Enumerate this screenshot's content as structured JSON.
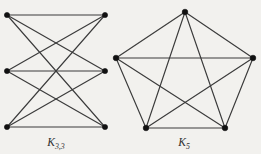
{
  "figure": {
    "name": "nonplanar-graphs-figure",
    "background_color": "#f2f1ee",
    "edge_color": "#3b3b3b",
    "vertex_color": "#111111",
    "caption_color": "#2e2e2e",
    "width": 261,
    "height": 154
  },
  "graphs": [
    {
      "id": "k33",
      "caption_main": "K",
      "caption_sub": "3,3",
      "caption_full": "K3,3",
      "caption_x": 56,
      "caption_y": 146,
      "layout": "bipartite-two-columns",
      "vertex_count": 6,
      "edge_count": 9,
      "vertex_radius": 2.6,
      "vertices": [
        {
          "id": "u1",
          "label": "u1",
          "x": 7,
          "y": 15,
          "part": "left"
        },
        {
          "id": "u2",
          "label": "u2",
          "x": 7,
          "y": 71,
          "part": "left"
        },
        {
          "id": "u3",
          "label": "u3",
          "x": 7,
          "y": 127,
          "part": "left"
        },
        {
          "id": "v1",
          "label": "v1",
          "x": 105,
          "y": 15,
          "part": "right"
        },
        {
          "id": "v2",
          "label": "v2",
          "x": 105,
          "y": 71,
          "part": "right"
        },
        {
          "id": "v3",
          "label": "v3",
          "x": 105,
          "y": 127,
          "part": "right"
        }
      ],
      "edges": [
        {
          "from": "u1",
          "to": "v1"
        },
        {
          "from": "u1",
          "to": "v2"
        },
        {
          "from": "u1",
          "to": "v3"
        },
        {
          "from": "u2",
          "to": "v1"
        },
        {
          "from": "u2",
          "to": "v2"
        },
        {
          "from": "u2",
          "to": "v3"
        },
        {
          "from": "u3",
          "to": "v1"
        },
        {
          "from": "u3",
          "to": "v2"
        },
        {
          "from": "u3",
          "to": "v3"
        }
      ]
    },
    {
      "id": "k5",
      "caption_main": "K",
      "caption_sub": "5",
      "caption_full": "K5",
      "caption_x": 184,
      "caption_y": 146,
      "layout": "regular-pentagon",
      "vertex_count": 5,
      "edge_count": 10,
      "vertex_radius": 2.8,
      "vertices": [
        {
          "id": "p1",
          "label": "p1",
          "x": 185,
          "y": 12,
          "position": "top"
        },
        {
          "id": "p2",
          "label": "p2",
          "x": 253,
          "y": 58,
          "position": "upper-right"
        },
        {
          "id": "p3",
          "label": "p3",
          "x": 225,
          "y": 128,
          "position": "lower-right"
        },
        {
          "id": "p4",
          "label": "p4",
          "x": 146,
          "y": 128,
          "position": "lower-left"
        },
        {
          "id": "p5",
          "label": "p5",
          "x": 116,
          "y": 58,
          "position": "upper-left"
        }
      ],
      "edges": [
        {
          "from": "p1",
          "to": "p2"
        },
        {
          "from": "p2",
          "to": "p3"
        },
        {
          "from": "p3",
          "to": "p4"
        },
        {
          "from": "p4",
          "to": "p5"
        },
        {
          "from": "p5",
          "to": "p1"
        },
        {
          "from": "p1",
          "to": "p3"
        },
        {
          "from": "p1",
          "to": "p4"
        },
        {
          "from": "p2",
          "to": "p4"
        },
        {
          "from": "p2",
          "to": "p5"
        },
        {
          "from": "p3",
          "to": "p5"
        }
      ]
    }
  ]
}
